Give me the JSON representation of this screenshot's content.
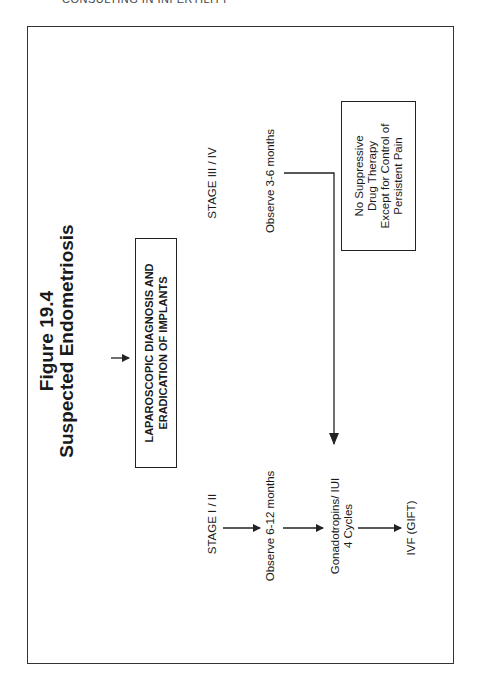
{
  "page": {
    "running_header": "CONSULTING IN INFERTILITY"
  },
  "figure": {
    "number_label": "Figure 19.4",
    "title": "Suspected Endometriosis",
    "orientation": "rotated 90° counter-clockwise",
    "nodes": {
      "laparoscopy": {
        "line1": "LAPAROSCOPIC DIAGNOSIS AND",
        "line2": "ERADICATION OF IMPLANTS"
      },
      "stage_early": "STAGE I / II",
      "stage_late": "STAGE III / IV",
      "observe_early": "Observe 6-12 months",
      "observe_late": "Observe 3-6 months",
      "gonadotropins": {
        "line1": "Gonadotropins/ IUI",
        "line2": "4 Cycles"
      },
      "ivf": "IVF (GIFT)",
      "suppressive_note": {
        "line1": "No Suppressive",
        "line2": "Drug Therapy",
        "line3": "Except for Control of",
        "line4": "Persistent Pain"
      }
    },
    "edges": [
      {
        "from": "Suspected Endometriosis",
        "to": "LAPAROSCOPIC DIAGNOSIS AND ERADICATION OF IMPLANTS"
      },
      {
        "from": "STAGE I / II",
        "to": "Observe 6-12 months"
      },
      {
        "from": "Observe 6-12 months",
        "to": "Gonadotropins/ IUI 4 Cycles"
      },
      {
        "from": "Gonadotropins/ IUI 4 Cycles",
        "to": "IVF (GIFT)"
      },
      {
        "from": "Observe 3-6 months",
        "to": "Gonadotropins/ IUI 4 Cycles"
      }
    ],
    "colors": {
      "line": "#222222",
      "text": "#1a1a1a",
      "background": "#ffffff"
    }
  }
}
